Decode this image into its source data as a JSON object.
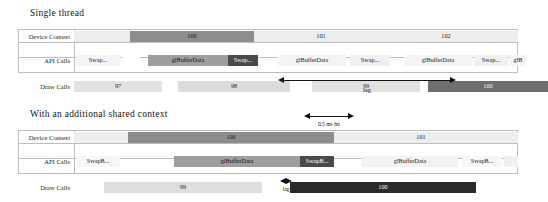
{
  "figure": {
    "type": "timeline-gantt",
    "panels": [
      {
        "id": "single",
        "title": "Single thread",
        "rows": [
          {
            "label": "Device Context",
            "segments": [
              {
                "label": "",
                "x": 0,
                "w": 56,
                "shade": "#ededed"
              },
              {
                "label": "100",
                "x": 56,
                "w": 124,
                "shade": "#8d8d8d",
                "text": "#1c1c1c"
              },
              {
                "label": "101",
                "x": 180,
                "w": 134,
                "shade": "#ededed"
              },
              {
                "label": "102",
                "x": 314,
                "w": 116,
                "shade": "#ededed"
              },
              {
                "label": "",
                "x": 430,
                "w": 14,
                "shade": "#ededed"
              }
            ]
          },
          {
            "label": "API Calls",
            "segments": [
              {
                "label": "Swap...",
                "x": 2,
                "w": 44,
                "shade": "#f4f4f4"
              },
              {
                "label": "",
                "x": 48,
                "w": 18,
                "shade": "#ffffff"
              },
              {
                "label": "glBufferData",
                "x": 74,
                "w": 80,
                "shade": "#9e9e9e",
                "text": "#111111"
              },
              {
                "label": "Swap...",
                "x": 154,
                "w": 30,
                "shade": "#4a4a4a",
                "text": "#ffffff"
              },
              {
                "label": "glBufferData",
                "x": 204,
                "w": 68,
                "shade": "#f4f4f4"
              },
              {
                "label": "Swap...",
                "x": 276,
                "w": 40,
                "shade": "#f0f0f0"
              },
              {
                "label": "glBufferData",
                "x": 330,
                "w": 68,
                "shade": "#f4f4f4"
              },
              {
                "label": "Swap...",
                "x": 400,
                "w": 34,
                "shade": "#f0f0f0"
              },
              {
                "label": "glB",
                "x": 436,
                "w": 16,
                "shade": "#f4f4f4"
              }
            ]
          },
          {
            "label": "Draw Calls",
            "segments": [
              {
                "label": "97",
                "x": 0,
                "w": 88,
                "shade": "#e2e2e2"
              },
              {
                "label": "98",
                "x": 104,
                "w": 112,
                "shade": "#dcdcdc"
              },
              {
                "label": "99",
                "x": 238,
                "w": 108,
                "shade": "#e2e2e2"
              },
              {
                "label": "100",
                "x": 354,
                "w": 120,
                "shade": "#6e6e6e",
                "text": "#f2f2f2"
              }
            ]
          }
        ],
        "arrow": {
          "x1": 204,
          "x2": 382,
          "caption": "lag"
        }
      },
      {
        "id": "shared",
        "title": "With an additional shared context",
        "top_arrow": {
          "x1": 230,
          "x2": 280,
          "caption": "0.5 ms hit"
        },
        "rows": [
          {
            "label": "Device Context",
            "segments": [
              {
                "label": "",
                "x": 0,
                "w": 54,
                "shade": "#ededed"
              },
              {
                "label": "100",
                "x": 54,
                "w": 206,
                "shade": "#8d8d8d",
                "text": "#1c1c1c"
              },
              {
                "label": "101",
                "x": 260,
                "w": 174,
                "shade": "#ededed"
              },
              {
                "label": "",
                "x": 434,
                "w": 10,
                "shade": "#ededed"
              }
            ]
          },
          {
            "label": "API Calls",
            "segments": [
              {
                "label": "SwapB...",
                "x": 2,
                "w": 44,
                "shade": "#f6f6f6"
              },
              {
                "label": "glBufferData",
                "x": 100,
                "w": 126,
                "shade": "#9e9e9e",
                "text": "#111111"
              },
              {
                "label": "SwapB...",
                "x": 226,
                "w": 34,
                "shade": "#4a4a4a",
                "text": "#ffffff"
              },
              {
                "label": "glBufferData",
                "x": 288,
                "w": 96,
                "shade": "#f2f2f2"
              },
              {
                "label": "SwapB...",
                "x": 388,
                "w": 40,
                "shade": "#f6f6f6"
              },
              {
                "label": "",
                "x": 430,
                "w": 14,
                "shade": "#f0f0f0"
              }
            ]
          },
          {
            "label": "Draw Calls",
            "segments": [
              {
                "label": "99",
                "x": 30,
                "w": 158,
                "shade": "#dedede"
              },
              {
                "label": "100",
                "x": 216,
                "w": 186,
                "shade": "#2a2a2a",
                "text": "#f5f5f5"
              }
            ]
          }
        ],
        "arrow": {
          "x1": 206,
          "x2": 218,
          "caption": "lag"
        }
      }
    ]
  }
}
